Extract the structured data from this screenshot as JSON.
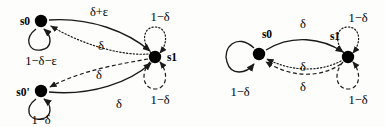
{
  "figure": {
    "type": "state-transition-diagram-pair",
    "background_color": "#fdfdfc",
    "stroke_color": "#1a1a1a",
    "node_fill_color": "#000000",
    "diagrams": [
      {
        "id": "left-diagram",
        "name": "three-state-chain",
        "nodes": [
          {
            "id": "s0",
            "label": "s0",
            "x": 41,
            "y": 21
          },
          {
            "id": "s0p",
            "label": "s0'",
            "x": 41,
            "y": 91
          },
          {
            "id": "s1",
            "label": "s1",
            "x": 155,
            "y": 57
          }
        ],
        "self_loops": [
          {
            "id": "s0-loop",
            "from": "s0",
            "label": "1−δ−ε",
            "style": "solid",
            "label_x": 41,
            "label_y": 52
          },
          {
            "id": "s0p-loop",
            "from": "s0p",
            "label": "1−δ",
            "style": "solid",
            "label_x": 41,
            "label_y": 121
          },
          {
            "id": "s1-loop-top",
            "from": "s1",
            "label": "1−δ",
            "style": "dotted",
            "label_x": 160,
            "label_y": 17
          },
          {
            "id": "s1-loop-bot",
            "from": "s1",
            "label": "1−δ",
            "style": "dashed",
            "label_x": 160,
            "label_y": 100
          }
        ],
        "edges": [
          {
            "id": "e-s0-s1-top",
            "from": "s0",
            "to": "s1",
            "label": "δ+ε",
            "style": "solid",
            "label_x": 99,
            "label_y": 12
          },
          {
            "id": "e-s1-s0",
            "from": "s1",
            "to": "s0",
            "label": "δ",
            "style": "dotted",
            "label_x": 101,
            "label_y": 45
          },
          {
            "id": "e-s1-s0p",
            "from": "s1",
            "to": "s0p",
            "label": "δ",
            "style": "dashed",
            "label_x": 99,
            "label_y": 74
          },
          {
            "id": "e-s0p-s1",
            "from": "s0p",
            "to": "s1",
            "label": "δ",
            "style": "solid",
            "label_x": 119,
            "label_y": 103
          }
        ]
      },
      {
        "id": "right-diagram",
        "name": "two-state-chain",
        "nodes": [
          {
            "id": "s0",
            "label": "s0",
            "x": 259,
            "y": 54
          },
          {
            "id": "s1",
            "label": "s1",
            "x": 348,
            "y": 57
          }
        ],
        "self_loops": [
          {
            "id": "s0-loop",
            "from": "s0",
            "label": "1−δ",
            "style": "solid",
            "label_x": 243,
            "label_y": 92
          },
          {
            "id": "s1-loop-top",
            "from": "s1",
            "label": "1−δ",
            "style": "dotted",
            "label_x": 357,
            "label_y": 18
          },
          {
            "id": "s1-loop-bot",
            "from": "s1",
            "label": "1−δ",
            "style": "dashed",
            "label_x": 357,
            "label_y": 100
          }
        ],
        "edges": [
          {
            "id": "e-s0-s1",
            "from": "s0",
            "to": "s1",
            "label": "δ",
            "style": "solid",
            "label_x": 302,
            "label_y": 23
          },
          {
            "id": "e-s1-s0-dotted",
            "from": "s1",
            "to": "s0",
            "label": "δ",
            "style": "dotted",
            "label_x": 302,
            "label_y": 67
          },
          {
            "id": "e-s1-s0-dashed",
            "from": "s1",
            "to": "s0",
            "label": "δ",
            "style": "dashed",
            "label_x": 302,
            "label_y": 87
          }
        ]
      }
    ],
    "labels": {
      "left": {
        "s0": "s0",
        "s0_prime": "s0'",
        "s1": "s1",
        "s0_loop": "1−δ−ε",
        "s0p_loop": "1−δ",
        "s1_loop_top": "1−δ",
        "s1_loop_bottom": "1−δ",
        "edge_s0_s1": "δ+ε",
        "edge_s1_s0": "δ",
        "edge_s1_s0p": "δ",
        "edge_s0p_s1": "δ"
      },
      "right": {
        "s0": "s0",
        "s1": "s1",
        "s0_loop": "1−δ",
        "s1_loop_top": "1−δ",
        "s1_loop_bottom": "1−δ",
        "edge_s0_s1": "δ",
        "edge_s1_s0_dotted": "δ",
        "edge_s1_s0_dashed": "δ"
      }
    }
  }
}
